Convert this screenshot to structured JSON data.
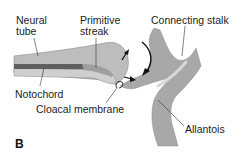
{
  "figure": {
    "panel_letter": "B",
    "labels": {
      "neural_tube_line1": "Neural",
      "neural_tube_line2": "tube",
      "primitive_streak_line1": "Primitive",
      "primitive_streak_line2": "streak",
      "connecting_stalk": "Connecting stalk",
      "notochord": "Notochord",
      "cloacal_membrane": "Cloacal membrane",
      "allantois": "Allantois"
    },
    "colors": {
      "tissue_light": "#b9b9b9",
      "tissue_mid": "#a6a6a6",
      "notochord": "#5f5f5f",
      "outline": "#555555",
      "leader_line": "#333333",
      "arrow": "#111111",
      "text": "#222222"
    }
  }
}
